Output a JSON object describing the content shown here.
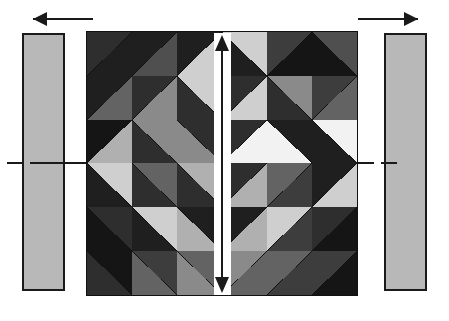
{
  "figure": {
    "canvas": {
      "width": 449,
      "height": 321,
      "background": "#ffffff"
    }
  },
  "palette": {
    "black": "#151515",
    "near_black": "#1f1f1f",
    "dark": "#2e2e2e",
    "dark_mid": "#3d3d3d",
    "mid_dark": "#4f4f4f",
    "mid": "#636363",
    "mid_light": "#8a8a8a",
    "light": "#b0b0b0",
    "pale": "#cfcfcf",
    "white": "#f2f2f2",
    "bar_fill": "#b8b8b8",
    "outline": "#1a1a1a"
  },
  "side_bars": {
    "left": {
      "label": "left-guide-bar",
      "x": 22,
      "y": 33,
      "width": 43,
      "height": 258,
      "fill": "#b8b8b8",
      "stroke": "#1a1a1a"
    },
    "right": {
      "label": "right-guide-bar",
      "x": 384,
      "y": 33,
      "width": 43,
      "height": 258,
      "fill": "#b8b8b8",
      "stroke": "#1a1a1a"
    }
  },
  "direction_arrows": [
    {
      "name": "left-direction-arrow",
      "points": "left",
      "x": 33,
      "y": 12,
      "length": 60
    },
    {
      "name": "right-direction-arrow",
      "points": "right",
      "x": 358,
      "y": 12,
      "length": 60
    }
  ],
  "center_arrow": {
    "name": "vertical-double-arrow",
    "points": "both",
    "x": 214,
    "y": 33,
    "width": 17,
    "height": 262,
    "bar_color": "#ffffff",
    "stroke": "#1a1a1a"
  },
  "centerlines": [
    {
      "name": "centerline-left-outer",
      "x": 7,
      "y": 162,
      "width": 16
    },
    {
      "name": "centerline-left-inner",
      "x": 30,
      "y": 162,
      "width": 56
    },
    {
      "name": "centerline-right-inner",
      "x": 358,
      "y": 162,
      "width": 16
    },
    {
      "name": "centerline-right-outer",
      "x": 381,
      "y": 162,
      "width": 16
    }
  ],
  "grid": {
    "name": "mosaic-grid",
    "x": 86,
    "y": 31,
    "width": 272,
    "height": 265,
    "rows": 6,
    "cols": 6,
    "cells": [
      [
        {
          "split": "anti",
          "a": "#2e2e2e",
          "b": "#1f1f1f"
        },
        {
          "split": "anti",
          "a": "#1f1f1f",
          "b": "#4f4f4f"
        },
        {
          "split": "anti",
          "a": "#1f1f1f",
          "b": "#cfcfcf"
        },
        {
          "split": "main",
          "a": "#cfcfcf",
          "b": "#1f1f1f"
        },
        {
          "split": "anti",
          "a": "#3d3d3d",
          "b": "#151515"
        },
        {
          "split": "main",
          "a": "#4f4f4f",
          "b": "#151515"
        }
      ],
      [
        {
          "split": "anti",
          "a": "#1f1f1f",
          "b": "#636363"
        },
        {
          "split": "anti",
          "a": "#2e2e2e",
          "b": "#8a8a8a"
        },
        {
          "split": "main",
          "a": "#cfcfcf",
          "b": "#2e2e2e"
        },
        {
          "split": "anti",
          "a": "#2e2e2e",
          "b": "#cfcfcf"
        },
        {
          "split": "main",
          "a": "#8a8a8a",
          "b": "#2e2e2e"
        },
        {
          "split": "anti",
          "a": "#3d3d3d",
          "b": "#636363"
        }
      ],
      [
        {
          "split": "anti",
          "a": "#151515",
          "b": "#b0b0b0"
        },
        {
          "split": "main",
          "a": "#8a8a8a",
          "b": "#2e2e2e"
        },
        {
          "split": "main",
          "a": "#2e2e2e",
          "b": "#8a8a8a"
        },
        {
          "split": "anti",
          "a": "#2e2e2e",
          "b": "#f2f2f2"
        },
        {
          "split": "main",
          "a": "#1f1f1f",
          "b": "#f2f2f2"
        },
        {
          "split": "main",
          "a": "#f2f2f2",
          "b": "#1f1f1f"
        }
      ],
      [
        {
          "split": "main",
          "a": "#cfcfcf",
          "b": "#1f1f1f"
        },
        {
          "split": "main",
          "a": "#636363",
          "b": "#2e2e2e"
        },
        {
          "split": "main",
          "a": "#b0b0b0",
          "b": "#2e2e2e"
        },
        {
          "split": "anti",
          "a": "#2e2e2e",
          "b": "#b0b0b0"
        },
        {
          "split": "anti",
          "a": "#636363",
          "b": "#3d3d3d"
        },
        {
          "split": "anti",
          "a": "#1f1f1f",
          "b": "#cfcfcf"
        }
      ],
      [
        {
          "split": "main",
          "a": "#2e2e2e",
          "b": "#151515"
        },
        {
          "split": "main",
          "a": "#cfcfcf",
          "b": "#1f1f1f"
        },
        {
          "split": "main",
          "a": "#1f1f1f",
          "b": "#b0b0b0"
        },
        {
          "split": "anti",
          "a": "#1f1f1f",
          "b": "#b0b0b0"
        },
        {
          "split": "anti",
          "a": "#cfcfcf",
          "b": "#3d3d3d"
        },
        {
          "split": "anti",
          "a": "#2e2e2e",
          "b": "#151515"
        }
      ],
      [
        {
          "split": "main",
          "a": "#151515",
          "b": "#2e2e2e"
        },
        {
          "split": "main",
          "a": "#3d3d3d",
          "b": "#636363"
        },
        {
          "split": "main",
          "a": "#636363",
          "b": "#8a8a8a"
        },
        {
          "split": "anti",
          "a": "#8a8a8a",
          "b": "#636363"
        },
        {
          "split": "anti",
          "a": "#636363",
          "b": "#3d3d3d"
        },
        {
          "split": "anti",
          "a": "#3d3d3d",
          "b": "#151515"
        }
      ]
    ]
  }
}
